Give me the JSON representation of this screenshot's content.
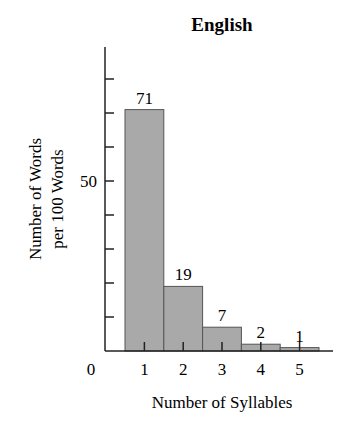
{
  "chart_data": {
    "type": "bar",
    "title": "English",
    "xlabel": "Number of Syllables",
    "ylabel": [
      "Number of Words",
      "per 100 Words"
    ],
    "categories": [
      "1",
      "2",
      "3",
      "4",
      "5"
    ],
    "values": [
      71,
      19,
      7,
      2,
      1
    ],
    "data_labels": [
      "71",
      "19",
      "7",
      "2",
      "1"
    ],
    "ylim": [
      0,
      85
    ],
    "y_ticks": [
      10,
      20,
      30,
      40,
      50,
      60,
      70,
      80
    ],
    "y_tick_labels": [
      {
        "value": 0,
        "label": "0"
      },
      {
        "value": 50,
        "label": "50"
      }
    ],
    "grid": false,
    "legend": null,
    "bar_color": "#a9a9a9",
    "bar_edge_color": "#555555",
    "axis_color": "#222222"
  }
}
